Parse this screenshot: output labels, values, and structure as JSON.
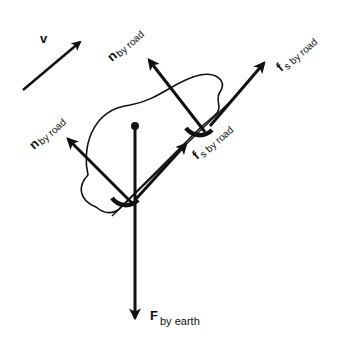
{
  "diagram": {
    "type": "free-body diagram",
    "colors": {
      "ink": "#111111",
      "background": "#ffffff"
    },
    "velocity": {
      "symbol": "v"
    },
    "forces": {
      "normal_front": {
        "symbol": "n",
        "subscript": "by road"
      },
      "normal_rear": {
        "symbol": "n",
        "subscript": "by road"
      },
      "friction_front": {
        "symbol": "f",
        "subscript": "s by road"
      },
      "friction_rear": {
        "symbol": "f",
        "subscript": "s by road"
      },
      "gravity": {
        "symbol": "F",
        "subscript": "by earth"
      }
    }
  }
}
